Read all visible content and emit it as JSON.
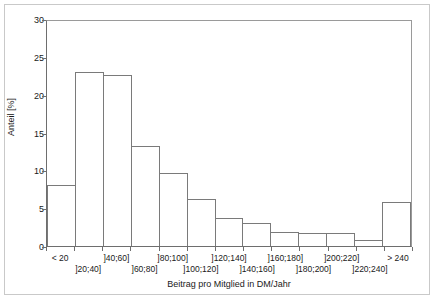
{
  "chart_data": {
    "type": "bar",
    "title": "",
    "subtitle": "",
    "xlabel": "Beitrag pro Mitglied in DM/Jahr",
    "ylabel": "Anteil [%]",
    "categories": [
      "< 20",
      "]20;40]",
      "]40;60]",
      "]60;80]",
      "]80;100]",
      "]100;120]",
      "]120;140]",
      "]140;160]",
      "]160;180]",
      "]180;200]",
      "]200;220]",
      "]220;240]",
      "> 240"
    ],
    "values": [
      8.0,
      23.0,
      22.6,
      13.2,
      9.7,
      6.2,
      3.7,
      3.0,
      1.9,
      1.7,
      1.7,
      0.8,
      5.8
    ],
    "ylim": [
      0,
      30
    ],
    "yticks": [
      0,
      5,
      10,
      15,
      20,
      25,
      30
    ],
    "ytick_labels": [
      "0",
      "5",
      "10",
      "15",
      "20",
      "25",
      "30"
    ],
    "grid": false,
    "legend": null,
    "legend_position": "none",
    "bar_fill": "#ffffff",
    "bar_edge": "#7a7a7a",
    "axis_color": "#6e6e6e",
    "frame_color": "#c9c9c9",
    "background": "#ffffff",
    "xlabel_rows": [
      0,
      1,
      0,
      1,
      0,
      1,
      0,
      1,
      0,
      1,
      0,
      1,
      0
    ]
  }
}
